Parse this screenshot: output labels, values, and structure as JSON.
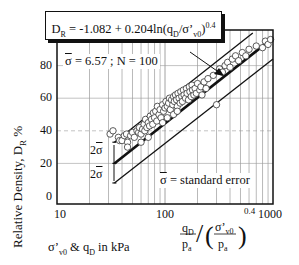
{
  "chart_data": {
    "type": "scatter",
    "title": "",
    "xlabel": "q_D/p_a / (σ'_v0/p_a)^0.4",
    "xunits_note": "σ'v0 & qD in kPa",
    "ylabel": "Relative Density, D_R %",
    "xscale": "log",
    "xlim": [
      10,
      1000
    ],
    "ylim": [
      0,
      85
    ],
    "x_ticks": [
      "10",
      "100",
      "1000"
    ],
    "y_ticks": [
      "0",
      "20",
      "40",
      "60",
      "80"
    ],
    "grid": true,
    "equation": "D_R = -1.082 + 0.204ln(q_D/σ'_v0)^0.4",
    "stats": {
      "sigma_bar": 6.57,
      "N": 100
    },
    "legend_note": "σ̄ = standard error",
    "band_labels": [
      "2σ̄",
      "2σ̄"
    ],
    "series": [
      {
        "name": "Regression line",
        "style": "thick",
        "x": [
          34,
          1000
        ],
        "y": [
          20,
          97
        ]
      },
      {
        "name": "+2σ̄ bound",
        "style": "thin",
        "x": [
          34,
          650
        ],
        "y": [
          33,
          100
        ]
      },
      {
        "name": "-2σ̄ bound",
        "style": "thin",
        "x": [
          34,
          1000
        ],
        "y": [
          8,
          84
        ]
      },
      {
        "name": "Data points (N=100)",
        "style": "open-circle",
        "points": [
          [
            31,
            38
          ],
          [
            33,
            40
          ],
          [
            37,
            36
          ],
          [
            38,
            34
          ],
          [
            40,
            34
          ],
          [
            42,
            37
          ],
          [
            44,
            38
          ],
          [
            45,
            33
          ],
          [
            48,
            37
          ],
          [
            50,
            39
          ],
          [
            52,
            36
          ],
          [
            55,
            40
          ],
          [
            57,
            39
          ],
          [
            58,
            42
          ],
          [
            60,
            38
          ],
          [
            62,
            41
          ],
          [
            64,
            44
          ],
          [
            65,
            40
          ],
          [
            66,
            47
          ],
          [
            68,
            42
          ],
          [
            70,
            45
          ],
          [
            72,
            43
          ],
          [
            73,
            49
          ],
          [
            75,
            47
          ],
          [
            77,
            44
          ],
          [
            78,
            51
          ],
          [
            80,
            48
          ],
          [
            82,
            52
          ],
          [
            84,
            46
          ],
          [
            85,
            55
          ],
          [
            88,
            50
          ],
          [
            90,
            53
          ],
          [
            92,
            48
          ],
          [
            95,
            56
          ],
          [
            97,
            52
          ],
          [
            100,
            54
          ],
          [
            102,
            58
          ],
          [
            105,
            55
          ],
          [
            108,
            57
          ],
          [
            110,
            60
          ],
          [
            112,
            53
          ],
          [
            115,
            59
          ],
          [
            118,
            56
          ],
          [
            120,
            61
          ],
          [
            122,
            58
          ],
          [
            125,
            62
          ],
          [
            128,
            59
          ],
          [
            130,
            55
          ],
          [
            132,
            63
          ],
          [
            135,
            60
          ],
          [
            138,
            57
          ],
          [
            140,
            64
          ],
          [
            143,
            61
          ],
          [
            145,
            58
          ],
          [
            148,
            65
          ],
          [
            150,
            62
          ],
          [
            155,
            60
          ],
          [
            158,
            66
          ],
          [
            160,
            63
          ],
          [
            165,
            59
          ],
          [
            168,
            67
          ],
          [
            170,
            64
          ],
          [
            175,
            61
          ],
          [
            178,
            68
          ],
          [
            180,
            65
          ],
          [
            185,
            62
          ],
          [
            190,
            66
          ],
          [
            195,
            63
          ],
          [
            200,
            69
          ],
          [
            210,
            65
          ],
          [
            215,
            67
          ],
          [
            220,
            62
          ],
          [
            230,
            70
          ],
          [
            240,
            66
          ],
          [
            250,
            72
          ],
          [
            120,
            50
          ],
          [
            130,
            52
          ],
          [
            95,
            45
          ],
          [
            105,
            48
          ],
          [
            60,
            33
          ],
          [
            70,
            36
          ],
          [
            45,
            30
          ],
          [
            300,
            56
          ],
          [
            280,
            74
          ],
          [
            320,
            78
          ],
          [
            340,
            76
          ],
          [
            360,
            80
          ],
          [
            380,
            82
          ],
          [
            400,
            79
          ],
          [
            420,
            84
          ],
          [
            450,
            86
          ],
          [
            480,
            83
          ],
          [
            520,
            88
          ],
          [
            560,
            86
          ],
          [
            600,
            90
          ],
          [
            700,
            92
          ],
          [
            800,
            91
          ],
          [
            850,
            95
          ],
          [
            900,
            93
          ],
          [
            950,
            96
          ]
        ]
      }
    ]
  },
  "labels": {
    "equation_lhs": "D",
    "equation_lhs_sub": "R",
    "equation_rhs_a": " = -1.082 + 0.204ln(q",
    "equation_rhs_sub1": "D",
    "equation_rhs_b": "/σ’",
    "equation_rhs_sub2": "v0",
    "equation_rhs_c": ")",
    "equation_rhs_sup": "0.4",
    "stats_sigma": "σ",
    "stats_rest": " = 6.57 ;  N = 100",
    "se_sigma": "σ",
    "se_rest": " = standard error",
    "ylabel": "Relative Density, D",
    "ylabel_sub": "R",
    "ylabel_tail": " %",
    "xunits_a": "σ’",
    "xunits_sub1": "v0",
    "xunits_b": " & q",
    "xunits_sub2": "D",
    "xunits_c": " in kPa",
    "band_upper_a": "2",
    "band_upper_sigma": "σ",
    "band_lower_a": "2",
    "band_lower_sigma": "σ",
    "frac_num": "q",
    "frac_num_sub": "D",
    "frac_den": "p",
    "frac_den_sub": "a",
    "frac2_num": "σ’",
    "frac2_num_sub": "v0",
    "frac2_den": "p",
    "frac2_den_sub": "a",
    "frac_exp": "0.4",
    "ytick_0": "0",
    "ytick_20": "20",
    "ytick_40": "40",
    "ytick_60": "60",
    "ytick_80": "80",
    "xtick_10": "10",
    "xtick_100": "100",
    "xtick_1000": "1000"
  }
}
